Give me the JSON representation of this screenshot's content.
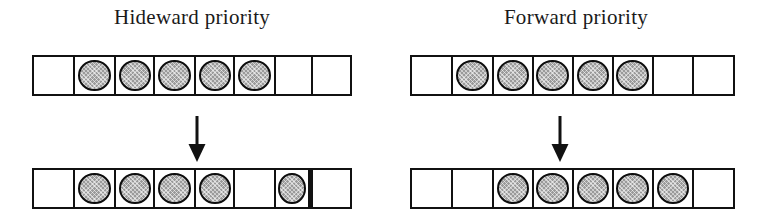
{
  "figure": {
    "background_color": "#ffffff",
    "ink_color": "#111111",
    "token_fill_color": "#9a9a9a",
    "token_outline_color": "#0d0d0d",
    "cell_count": 8,
    "arrow_glyph": "down-arrow"
  },
  "panels": [
    {
      "id": "hideward",
      "title": "Hideward priority",
      "before": {
        "label": "before",
        "cells": [
          {
            "index": 1,
            "filled": false,
            "thick_right_border": false
          },
          {
            "index": 2,
            "filled": true,
            "thick_right_border": false
          },
          {
            "index": 3,
            "filled": true,
            "thick_right_border": false
          },
          {
            "index": 4,
            "filled": true,
            "thick_right_border": false
          },
          {
            "index": 5,
            "filled": true,
            "thick_right_border": false
          },
          {
            "index": 6,
            "filled": true,
            "thick_right_border": false
          },
          {
            "index": 7,
            "filled": false,
            "thick_right_border": false
          },
          {
            "index": 8,
            "filled": false,
            "thick_right_border": false
          }
        ]
      },
      "after": {
        "label": "after",
        "cells": [
          {
            "index": 1,
            "filled": false,
            "thick_right_border": false
          },
          {
            "index": 2,
            "filled": true,
            "thick_right_border": false
          },
          {
            "index": 3,
            "filled": true,
            "thick_right_border": false
          },
          {
            "index": 4,
            "filled": true,
            "thick_right_border": false
          },
          {
            "index": 5,
            "filled": true,
            "thick_right_border": false
          },
          {
            "index": 6,
            "filled": false,
            "thick_right_border": false
          },
          {
            "index": 7,
            "filled": true,
            "thick_right_border": true
          },
          {
            "index": 8,
            "filled": false,
            "thick_right_border": false
          }
        ]
      }
    },
    {
      "id": "forward",
      "title": "Forward priority",
      "before": {
        "label": "before",
        "cells": [
          {
            "index": 1,
            "filled": false,
            "thick_right_border": false
          },
          {
            "index": 2,
            "filled": true,
            "thick_right_border": false
          },
          {
            "index": 3,
            "filled": true,
            "thick_right_border": false
          },
          {
            "index": 4,
            "filled": true,
            "thick_right_border": false
          },
          {
            "index": 5,
            "filled": true,
            "thick_right_border": false
          },
          {
            "index": 6,
            "filled": true,
            "thick_right_border": false
          },
          {
            "index": 7,
            "filled": false,
            "thick_right_border": false
          },
          {
            "index": 8,
            "filled": false,
            "thick_right_border": false
          }
        ]
      },
      "after": {
        "label": "after",
        "cells": [
          {
            "index": 1,
            "filled": false,
            "thick_right_border": false
          },
          {
            "index": 2,
            "filled": false,
            "thick_right_border": false
          },
          {
            "index": 3,
            "filled": true,
            "thick_right_border": false
          },
          {
            "index": 4,
            "filled": true,
            "thick_right_border": false
          },
          {
            "index": 5,
            "filled": true,
            "thick_right_border": false
          },
          {
            "index": 6,
            "filled": true,
            "thick_right_border": false
          },
          {
            "index": 7,
            "filled": true,
            "thick_right_border": false
          },
          {
            "index": 8,
            "filled": false,
            "thick_right_border": false
          }
        ]
      }
    }
  ]
}
